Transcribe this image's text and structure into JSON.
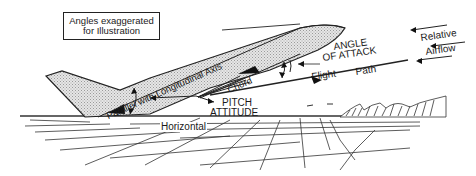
{
  "note": {
    "line1": "Angles exaggerated",
    "line2": "for Illustration"
  },
  "labels": {
    "longitudinal_axis": "Parallel with Longitudinal Axis",
    "chord": "Chord",
    "angle_of_attack_1": "ANGLE",
    "angle_of_attack_2": "OF ATTACK",
    "flight": "Flight",
    "path": "Path",
    "relative": "Relative",
    "airflow": "Airflow",
    "pitch": "PITCH",
    "attitude": "ATTITUDE",
    "horizontal": "Horizontal"
  },
  "colors": {
    "ink": "#1a1a1a",
    "fill": "#d4d4d4",
    "background": "#ffffff"
  }
}
